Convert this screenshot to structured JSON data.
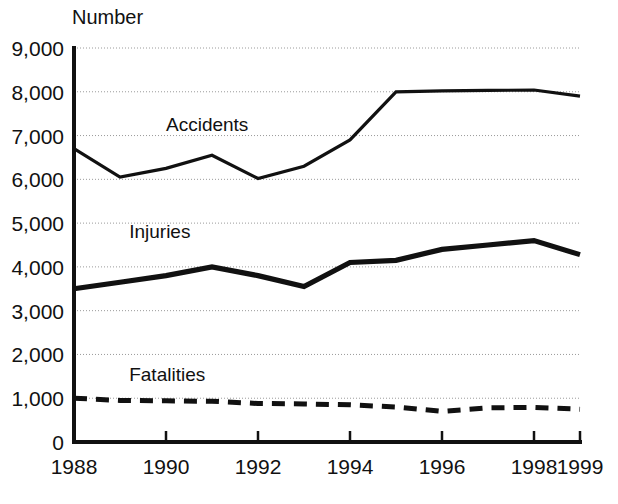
{
  "chart_data": {
    "type": "line",
    "title": "",
    "subtitle": "",
    "ylabel": "Number",
    "xlabel": "",
    "grid": true,
    "legend_position": "inline-labels",
    "x": [
      1988,
      1989,
      1990,
      1991,
      1992,
      1993,
      1994,
      1995,
      1996,
      1997,
      1998,
      1999
    ],
    "xlim": [
      1988,
      1999
    ],
    "ylim": [
      0,
      9000
    ],
    "xticks": [
      1988,
      1990,
      1992,
      1994,
      1996,
      1998,
      1999
    ],
    "xtick_labels": [
      "1988",
      "1990",
      "1992",
      "1994",
      "1996",
      "1998",
      "1999"
    ],
    "yticks": [
      0,
      1000,
      2000,
      3000,
      4000,
      5000,
      6000,
      7000,
      8000,
      9000
    ],
    "ytick_labels": [
      "0",
      "1,000",
      "2,000",
      "3,000",
      "4,000",
      "5,000",
      "6,000",
      "7,000",
      "8,000",
      "9,000"
    ],
    "series": [
      {
        "name": "Accidents",
        "style": "solid-thin",
        "label_x": 1990,
        "label_y": 7100,
        "values": [
          6700,
          6050,
          6250,
          6550,
          6020,
          6300,
          6900,
          8000,
          8020,
          8030,
          8040,
          7900
        ]
      },
      {
        "name": "Injuries",
        "style": "solid-thick",
        "label_x": 1989.2,
        "label_y": 4650,
        "values": [
          3500,
          3650,
          3800,
          4000,
          3800,
          3550,
          4100,
          4150,
          4400,
          4500,
          4600,
          4280
        ]
      },
      {
        "name": "Fatalities",
        "style": "dashed",
        "label_x": 1989.2,
        "label_y": 1400,
        "values": [
          1000,
          950,
          940,
          930,
          880,
          870,
          850,
          800,
          700,
          780,
          790,
          750
        ]
      }
    ]
  },
  "axis": {
    "y_title": "Number"
  }
}
